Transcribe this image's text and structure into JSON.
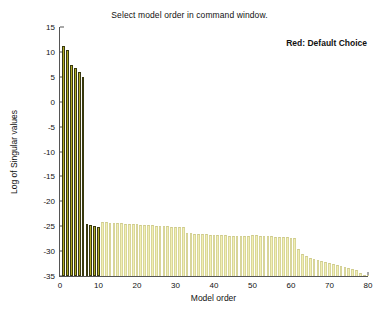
{
  "chart_data": {
    "type": "bar",
    "title": "Select model order in command window.",
    "annotation": "Red: Default Choice",
    "xlabel": "Model order",
    "ylabel": "Log of Singular values",
    "xlim": [
      0,
      80
    ],
    "ylim": [
      -35,
      15
    ],
    "xticks": [
      0,
      10,
      20,
      30,
      40,
      50,
      60,
      70,
      80
    ],
    "yticks": [
      -35,
      -30,
      -25,
      -20,
      -15,
      -10,
      -5,
      0,
      5,
      10,
      15
    ],
    "grid": false,
    "legend": "none",
    "colors": {
      "selected_bar": "#a81818",
      "highlight_bar": "#b0ab25",
      "normal_bar": "#f2f0b4",
      "bar_edge": "#3a3a10",
      "axis": "#555555",
      "text": "#111111",
      "background": "#ffffff"
    },
    "default_order": 6,
    "x": [
      1,
      2,
      3,
      4,
      5,
      6,
      7,
      8,
      9,
      10,
      11,
      12,
      13,
      14,
      15,
      16,
      17,
      18,
      19,
      20,
      21,
      22,
      23,
      24,
      25,
      26,
      27,
      28,
      29,
      30,
      31,
      32,
      33,
      34,
      35,
      36,
      37,
      38,
      39,
      40,
      41,
      42,
      43,
      44,
      45,
      46,
      47,
      48,
      49,
      50,
      51,
      52,
      53,
      54,
      55,
      56,
      57,
      58,
      59,
      60,
      61,
      62,
      63,
      64,
      65,
      66,
      67,
      68,
      69,
      70,
      71,
      72,
      73,
      74,
      75,
      76,
      77,
      78,
      79,
      80
    ],
    "values": [
      11.1,
      10.3,
      7.3,
      6.8,
      5.9,
      5.0,
      -24.6,
      -24.8,
      -25.0,
      -25.2,
      -24.2,
      -24.2,
      -24.3,
      -24.3,
      -24.4,
      -24.4,
      -24.5,
      -24.5,
      -24.6,
      -24.6,
      -24.7,
      -24.7,
      -24.8,
      -24.8,
      -24.9,
      -24.9,
      -25.0,
      -25.0,
      -25.1,
      -25.1,
      -25.2,
      -25.2,
      -26.4,
      -26.4,
      -26.5,
      -26.5,
      -26.6,
      -26.6,
      -26.7,
      -26.7,
      -26.8,
      -26.8,
      -26.8,
      -26.9,
      -26.9,
      -27.0,
      -27.0,
      -26.9,
      -26.9,
      -26.8,
      -26.8,
      -26.9,
      -26.9,
      -27.0,
      -27.0,
      -27.1,
      -27.1,
      -27.2,
      -27.2,
      -27.3,
      -27.4,
      -29.6,
      -30.6,
      -31.0,
      -31.3,
      -31.5,
      -31.8,
      -32.0,
      -32.2,
      -32.4,
      -32.6,
      -32.8,
      -33.0,
      -33.2,
      -33.4,
      -33.6,
      -33.8,
      -34.4,
      -34.8,
      -35.0
    ],
    "bar_styles": [
      "highlight",
      "highlight",
      "highlight",
      "highlight",
      "highlight",
      "selected",
      "highlight",
      "highlight",
      "highlight",
      "highlight",
      "normal",
      "normal",
      "normal",
      "normal",
      "normal",
      "normal",
      "normal",
      "normal",
      "normal",
      "normal",
      "normal",
      "normal",
      "normal",
      "normal",
      "normal",
      "normal",
      "normal",
      "normal",
      "normal",
      "normal",
      "normal",
      "normal",
      "normal",
      "normal",
      "normal",
      "normal",
      "normal",
      "normal",
      "normal",
      "normal",
      "normal",
      "normal",
      "normal",
      "normal",
      "normal",
      "normal",
      "normal",
      "normal",
      "normal",
      "normal",
      "normal",
      "normal",
      "normal",
      "normal",
      "normal",
      "normal",
      "normal",
      "normal",
      "normal",
      "normal",
      "normal",
      "normal",
      "normal",
      "normal",
      "normal",
      "normal",
      "normal",
      "normal",
      "normal",
      "normal",
      "normal",
      "normal",
      "normal",
      "normal",
      "normal",
      "normal",
      "normal",
      "normal",
      "normal",
      "normal"
    ]
  }
}
